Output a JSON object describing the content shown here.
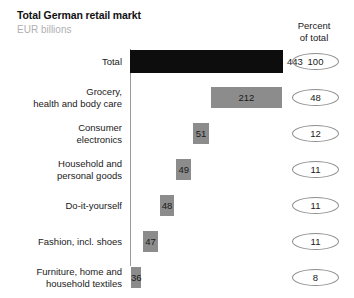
{
  "header": {
    "title": "Total German retail markt",
    "subtitle": "EUR billions",
    "percent_header_line1": "Percent",
    "percent_header_line2": "of total"
  },
  "chart_data": {
    "type": "bar",
    "subtype": "waterfall-breakdown",
    "title": "Total German retail markt",
    "subtitle": "EUR billions",
    "xlabel": "",
    "ylabel": "",
    "unit": "EUR billions",
    "percent_column_label": "Percent of total",
    "grid": false,
    "legend": "none",
    "axis_orientation": "vertical-baseline-left",
    "xlim": [
      0,
      443
    ],
    "categories": [
      "Total",
      "Grocery, health and body care",
      "Consumer electronics",
      "Household and personal goods",
      "Do-it-yourself",
      "Fashion, incl. shoes",
      "Furniture, home and household textiles"
    ],
    "values": [
      443,
      212,
      51,
      49,
      48,
      47,
      36
    ],
    "percent_of_total": [
      100,
      48,
      12,
      11,
      11,
      11,
      8
    ],
    "series": [
      {
        "name": "EUR billions",
        "values": [
          443,
          212,
          51,
          49,
          48,
          47,
          36
        ]
      },
      {
        "name": "Percent of total",
        "values": [
          100,
          48,
          12,
          11,
          11,
          11,
          8
        ]
      }
    ]
  },
  "rows": [
    {
      "label_line1": "Total",
      "label_line2": "",
      "value": "443",
      "percent": "100",
      "style": "total"
    },
    {
      "label_line1": "Grocery,",
      "label_line2": "health and body care",
      "value": "212",
      "percent": "48",
      "style": "segment"
    },
    {
      "label_line1": "Consumer",
      "label_line2": "electronics",
      "value": "51",
      "percent": "12",
      "style": "segment"
    },
    {
      "label_line1": "Household and",
      "label_line2": "personal goods",
      "value": "49",
      "percent": "11",
      "style": "segment"
    },
    {
      "label_line1": "Do-it-yourself",
      "label_line2": "",
      "value": "48",
      "percent": "11",
      "style": "segment"
    },
    {
      "label_line1": "Fashion, incl. shoes",
      "label_line2": "",
      "value": "47",
      "percent": "11",
      "style": "segment"
    },
    {
      "label_line1": "Furniture, home and",
      "label_line2": "household textiles",
      "value": "36",
      "percent": "8",
      "style": "segment"
    }
  ],
  "colors": {
    "total_bar": "#0d0d0d",
    "segment_bar": "#8c8c8c",
    "axis": "#9a9a9a",
    "subtitle": "#b0b0b0",
    "text": "#1a1a1a"
  }
}
